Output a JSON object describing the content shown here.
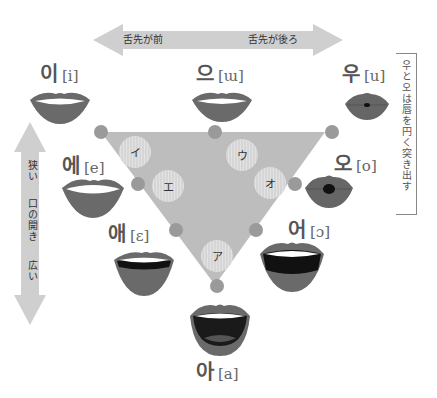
{
  "colors": {
    "triangle": "#b9b9b9",
    "node": "#9a9a9a",
    "bubble": "#d2d2d2",
    "arrow": "#cfcfcf",
    "lip": "#6a6a6a",
    "lip_dark": "#444444",
    "teeth": "#ffffff",
    "text": "#555555"
  },
  "top_arrow": {
    "left_label": "舌先が前",
    "right_label": "舌先が後ろ"
  },
  "left_arrow": {
    "top_label": "狭い",
    "middle_label": "口の開き",
    "bottom_label": "広い"
  },
  "side_note": "우と오は唇を円く突き出す",
  "vowels": [
    {
      "hangul": "이",
      "ipa": "[i]",
      "kana": "イ"
    },
    {
      "hangul": "으",
      "ipa": "[ɯ]",
      "kana": "ウ"
    },
    {
      "hangul": "우",
      "ipa": "[u]",
      "kana": ""
    },
    {
      "hangul": "에",
      "ipa": "[e]",
      "kana": "エ"
    },
    {
      "hangul": "오",
      "ipa": "[o]",
      "kana": "オ"
    },
    {
      "hangul": "애",
      "ipa": "[ɛ]",
      "kana": ""
    },
    {
      "hangul": "어",
      "ipa": "[ɔ]",
      "kana": ""
    },
    {
      "hangul": "아",
      "ipa": "[a]",
      "kana": "ア"
    }
  ]
}
